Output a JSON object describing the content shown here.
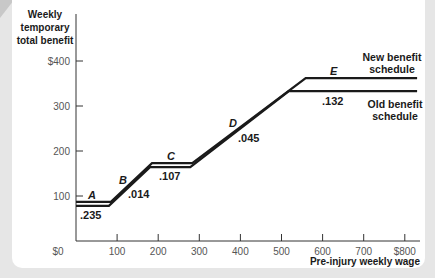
{
  "chart_data": {
    "type": "line",
    "title": "",
    "ylabel": "Weekly temporary total benefit",
    "ylabel_lines": [
      "Weekly",
      "temporary",
      "total benefit"
    ],
    "xlabel": "Pre-injury weekly wage",
    "xlim": [
      0,
      850
    ],
    "ylim": [
      0,
      420
    ],
    "x_ticks": [
      100,
      200,
      300,
      400,
      500,
      600,
      700,
      800
    ],
    "x_tick_labels": [
      "100",
      "200",
      "300",
      "400",
      "500",
      "600",
      "700",
      "$800"
    ],
    "y_ticks": [
      0,
      100,
      200,
      300,
      400
    ],
    "y_tick_labels": [
      "$0",
      "100",
      "200",
      "300",
      "$400"
    ],
    "x_origin_label": "$0",
    "grid": false,
    "series": [
      {
        "name": "New benefit schedule",
        "points": [
          [
            0,
            87
          ],
          [
            85,
            87
          ],
          [
            185,
            173
          ],
          [
            283,
            173
          ],
          [
            559,
            362
          ],
          [
            830,
            362
          ]
        ]
      },
      {
        "name": "Old benefit schedule",
        "points": [
          [
            0,
            78
          ],
          [
            80,
            78
          ],
          [
            180,
            164
          ],
          [
            278,
            164
          ],
          [
            518,
            333
          ],
          [
            830,
            333
          ]
        ]
      }
    ],
    "segment_labels": [
      {
        "segment": "A",
        "elasticity": ".235"
      },
      {
        "segment": "B",
        "elasticity": ".014"
      },
      {
        "segment": "C",
        "elasticity": ".107"
      },
      {
        "segment": "D",
        "elasticity": ".045"
      },
      {
        "segment": "E",
        "elasticity": ".132"
      }
    ],
    "legend": {
      "new": [
        "New benefit",
        "schedule"
      ],
      "old": [
        "Old benefit",
        "schedule"
      ],
      "position": "inline-right"
    }
  }
}
